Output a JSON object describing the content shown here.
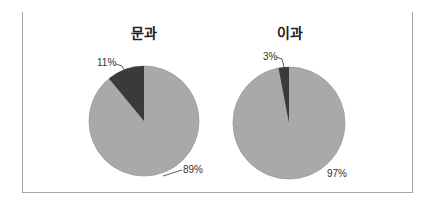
{
  "chart_data": [
    {
      "type": "pie",
      "title": "문과",
      "slices": [
        {
          "label": "11%",
          "value": 11,
          "color": "#3a3a3a"
        },
        {
          "label": "89%",
          "value": 89,
          "color": "#a9a9a9"
        }
      ]
    },
    {
      "type": "pie",
      "title": "이과",
      "slices": [
        {
          "label": "3%",
          "value": 3,
          "color": "#3a3a3a"
        },
        {
          "label": "97%",
          "value": 97,
          "color": "#a9a9a9"
        }
      ]
    }
  ],
  "charts": [
    {
      "title": "문과",
      "small_label": "11%",
      "large_label": "89%"
    },
    {
      "title": "이과",
      "small_label": "3%",
      "large_label": "97%"
    }
  ]
}
